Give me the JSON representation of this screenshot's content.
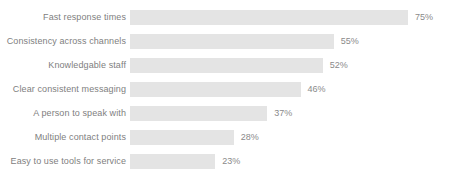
{
  "chart_data": {
    "type": "bar",
    "orientation": "horizontal",
    "title": "",
    "subtitle": "",
    "xlabel": "",
    "ylabel": "",
    "grid": false,
    "legend": false,
    "xlim": [
      0,
      75
    ],
    "value_suffix": "%",
    "bar_color": "#e4e4e4",
    "label_color": "#808080",
    "value_color": "#8a8a8a",
    "background_color": "#ffffff",
    "categories": [
      "Fast response times",
      "Consistency across channels",
      "Knowledgable staff",
      "Clear consistent messaging",
      "A person to speak with",
      "Multiple contact points",
      "Easy to use tools for service"
    ],
    "values": [
      75,
      55,
      52,
      46,
      37,
      28,
      23
    ],
    "value_labels": [
      "75%",
      "55%",
      "52%",
      "46%",
      "37%",
      "28%",
      "23%"
    ],
    "bars": [
      {
        "category": "Fast response times",
        "value": 75,
        "label": "75%"
      },
      {
        "category": "Consistency across channels",
        "value": 55,
        "label": "55%"
      },
      {
        "category": "Knowledgable staff",
        "value": 52,
        "label": "52%"
      },
      {
        "category": "Clear consistent messaging",
        "value": 46,
        "label": "46%"
      },
      {
        "category": "A person to speak with",
        "value": 37,
        "label": "37%"
      },
      {
        "category": "Multiple contact points",
        "value": 28,
        "label": "28%"
      },
      {
        "category": "Easy to use tools for service",
        "value": 23,
        "label": "23%"
      }
    ]
  }
}
